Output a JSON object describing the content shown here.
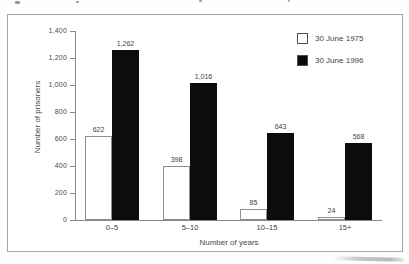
{
  "chart_data": {
    "type": "bar",
    "categories": [
      "0–5",
      "5–10",
      "10–15",
      "15+"
    ],
    "series": [
      {
        "name": "30 June 1975",
        "values": [
          622,
          398,
          85,
          24
        ],
        "fill": "#ffffff",
        "stroke": "#8f8f8f"
      },
      {
        "name": "30 June 1996",
        "values": [
          1262,
          1016,
          643,
          568
        ],
        "fill": "#0c0c0c",
        "stroke": "#0c0c0c"
      }
    ],
    "value_labels": {
      "30 June 1975": [
        "622",
        "398",
        "85",
        "24"
      ],
      "30 June 1996": [
        "1,262",
        "1,016",
        "643",
        "568"
      ]
    },
    "xlabel": "Number of years",
    "ylabel": "Number of prisoners",
    "ylim": [
      0,
      1400
    ],
    "ytick_step": 200,
    "ytick_labels": [
      "0",
      "200",
      "400",
      "600",
      "800",
      "1,000",
      "1,200",
      "1,400"
    ],
    "legend_position": "top-right",
    "grid": false
  },
  "colors": {
    "frame_border": "#a6a6a6",
    "axis": "#8a8a8a",
    "text": "#3f3f3f",
    "bar_1975_fill": "#ffffff",
    "bar_1975_border": "#8f8f8f",
    "bar_1996_fill": "#0c0c0c"
  }
}
